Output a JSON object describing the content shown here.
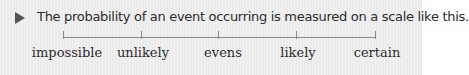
{
  "intro": {
    "icon": "play-triangle-icon",
    "text": "The probability of an event occurring is measured on a scale like this."
  },
  "scale": {
    "labels": [
      "impossible",
      "unlikely",
      "evens",
      "likely",
      "certain"
    ]
  },
  "colors": {
    "background": "#ebebeb",
    "text": "#2b2b2b",
    "line": "#8a8a8a",
    "bullet": "#555555"
  }
}
